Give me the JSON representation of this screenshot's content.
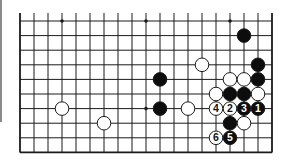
{
  "diagram": {
    "type": "go-board-fragment",
    "columns": 19,
    "rows": 10,
    "open_edges": [
      "top"
    ],
    "closed_edges": [
      "left",
      "right",
      "bottom"
    ],
    "grid": {
      "x0": 20,
      "dx": 14,
      "y0": 21,
      "dy": 14.6,
      "top_extend": 8
    },
    "colors": {
      "line": "#1a1a1a",
      "black_stone": "#0d0d0d",
      "white_stone": "#ffffff",
      "stone_outline": "#1a1a1a",
      "board": "#ffffff"
    },
    "stone_radius": 6.8,
    "star_points": [
      {
        "col": 3,
        "row": 0
      },
      {
        "col": 9,
        "row": 0
      },
      {
        "col": 15,
        "row": 0
      },
      {
        "col": 3,
        "row": 6
      },
      {
        "col": 9,
        "row": 6
      },
      {
        "col": 15,
        "row": 6
      }
    ],
    "stones": [
      {
        "color": "black",
        "col": 16,
        "row": 1,
        "label": ""
      },
      {
        "color": "white",
        "col": 13,
        "row": 3,
        "label": ""
      },
      {
        "color": "black",
        "col": 17,
        "row": 3,
        "label": ""
      },
      {
        "color": "black",
        "col": 10,
        "row": 4,
        "label": ""
      },
      {
        "color": "white",
        "col": 15,
        "row": 4,
        "label": ""
      },
      {
        "color": "white",
        "col": 16,
        "row": 4,
        "label": ""
      },
      {
        "color": "black",
        "col": 17,
        "row": 4,
        "label": ""
      },
      {
        "color": "white",
        "col": 14,
        "row": 5,
        "label": ""
      },
      {
        "color": "black",
        "col": 15,
        "row": 5,
        "label": ""
      },
      {
        "color": "black",
        "col": 16,
        "row": 5,
        "label": ""
      },
      {
        "color": "white",
        "col": 17,
        "row": 5,
        "label": ""
      },
      {
        "color": "white",
        "col": 3,
        "row": 6,
        "label": ""
      },
      {
        "color": "black",
        "col": 10,
        "row": 6,
        "label": ""
      },
      {
        "color": "white",
        "col": 12,
        "row": 6,
        "label": ""
      },
      {
        "color": "white",
        "col": 14,
        "row": 6,
        "label": "4"
      },
      {
        "color": "white",
        "col": 15,
        "row": 6,
        "label": "2"
      },
      {
        "color": "black",
        "col": 16,
        "row": 6,
        "label": "3"
      },
      {
        "color": "black",
        "col": 17,
        "row": 6,
        "label": "1"
      },
      {
        "color": "white",
        "col": 6,
        "row": 7,
        "label": ""
      },
      {
        "color": "black",
        "col": 15,
        "row": 7,
        "label": ""
      },
      {
        "color": "white",
        "col": 16,
        "row": 7,
        "label": ""
      },
      {
        "color": "white",
        "col": 14,
        "row": 8,
        "label": "6"
      },
      {
        "color": "black",
        "col": 15,
        "row": 8,
        "label": "5"
      }
    ],
    "move_sequence": [
      {
        "move": 1,
        "color": "black",
        "col": 17,
        "row": 6
      },
      {
        "move": 2,
        "color": "white",
        "col": 15,
        "row": 6
      },
      {
        "move": 3,
        "color": "black",
        "col": 16,
        "row": 6
      },
      {
        "move": 4,
        "color": "white",
        "col": 14,
        "row": 6
      },
      {
        "move": 5,
        "color": "black",
        "col": 15,
        "row": 8
      },
      {
        "move": 6,
        "color": "white",
        "col": 14,
        "row": 8
      }
    ]
  }
}
